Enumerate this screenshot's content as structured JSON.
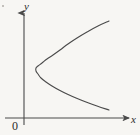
{
  "figure": {
    "background_color": "#f7f6f3",
    "ink_color": "#4a4a4a",
    "label_color": "#2b2b2b",
    "width": 140,
    "height": 135
  },
  "labels": {
    "y_axis": "y",
    "x_axis": "x",
    "origin": "0"
  },
  "chart_data": {
    "type": "line",
    "title": "",
    "xlabel": "x",
    "ylabel": "y",
    "grid": false,
    "legend": "none",
    "origin_label": "0",
    "axes": {
      "x_axis_pixel_y": 118,
      "y_axis_pixel_x": 24,
      "x_axis_start_px": 5,
      "x_axis_end_px": 132,
      "y_axis_top_px": 11,
      "y_axis_bottom_px": 125,
      "x_arrow": true,
      "y_arrow": true
    },
    "curve": {
      "name": "parabola",
      "description": "Parabola opening to the right, vertex left of center and above the x-axis",
      "opens": "right",
      "vertex_px": [
        36,
        68
      ],
      "upper_endpoint_px": [
        109,
        21
      ],
      "lower_endpoint_px": [
        109,
        110
      ],
      "stroke_width": 1.1,
      "points_px": [
        [
          109,
          21
        ],
        [
          98,
          26
        ],
        [
          87,
          32
        ],
        [
          77,
          38
        ],
        [
          68,
          44
        ],
        [
          60,
          50
        ],
        [
          53,
          55
        ],
        [
          47,
          59
        ],
        [
          42,
          63
        ],
        [
          38,
          66
        ],
        [
          36,
          68
        ],
        [
          36,
          71
        ],
        [
          38,
          74
        ],
        [
          41,
          78
        ],
        [
          46,
          82
        ],
        [
          52,
          86
        ],
        [
          59,
          90
        ],
        [
          67,
          94
        ],
        [
          76,
          98
        ],
        [
          86,
          102
        ],
        [
          97,
          106
        ],
        [
          109,
          110
        ]
      ]
    }
  }
}
